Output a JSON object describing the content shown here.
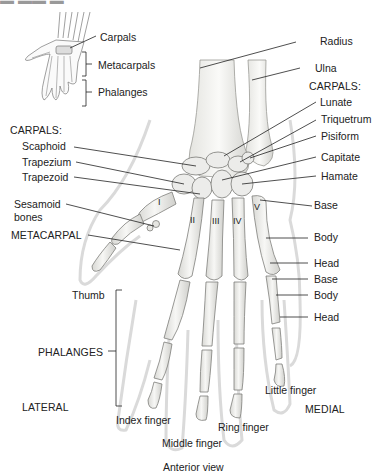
{
  "figure": {
    "view_caption": "Anterior view",
    "orientation": {
      "left": "LATERAL",
      "right": "MEDIAL"
    }
  },
  "inset": {
    "labels": [
      "Carpals",
      "Metacarpals",
      "Phalanges"
    ]
  },
  "forearm": {
    "labels": [
      "Radius",
      "Ulna"
    ]
  },
  "carpals_medial": {
    "heading": "CARPALS:",
    "labels": [
      "Lunate",
      "Triquetrum",
      "Pisiform",
      "Capitate",
      "Hamate"
    ]
  },
  "carpals_lateral": {
    "heading": "CARPALS:",
    "labels": [
      "Scaphoid",
      "Trapezium",
      "Trapezoid"
    ]
  },
  "sesamoid": {
    "label_line1": "Sesamoid",
    "label_line2": "bones"
  },
  "metacarpal": {
    "heading": "METACARPAL",
    "numerals": [
      "I",
      "II",
      "III",
      "IV",
      "V"
    ],
    "parts": [
      "Base",
      "Body",
      "Head"
    ]
  },
  "phalanx": {
    "heading": "PHALANGES",
    "parts": [
      "Base",
      "Body",
      "Head"
    ]
  },
  "fingers": {
    "thumb": "Thumb",
    "index": "Index finger",
    "middle": "Middle finger",
    "ring": "Ring finger",
    "little": "Little finger"
  },
  "colors": {
    "bone_fill": "#f2f2f0",
    "bone_stroke": "#8a8a8a",
    "bone_shade": "#c8c8c4",
    "skin_outline": "#d9d9d9",
    "leader_line": "#222222",
    "text": "#222222"
  }
}
